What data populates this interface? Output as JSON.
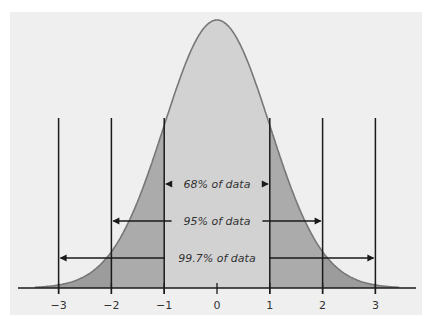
{
  "chart_data": {
    "type": "area",
    "title": "",
    "xlabel": "",
    "ylabel": "",
    "x_ticks": [
      "-3",
      "-2",
      "-1",
      "0",
      "1",
      "2",
      "3"
    ],
    "x_tick_values": [
      -3,
      -2,
      -1,
      0,
      1,
      2,
      3
    ],
    "xlim": [
      -3.4,
      3.4
    ],
    "grid": false,
    "legend": null,
    "regions": [
      {
        "name": "within_1_sd",
        "range": [
          -1,
          1
        ],
        "percent": 68,
        "label": "68% of data",
        "color": "#d2d2d2"
      },
      {
        "name": "within_2_sd",
        "range": [
          -2,
          2
        ],
        "percent": 95,
        "label": "95% of data",
        "color": "#ababab"
      },
      {
        "name": "within_3_sd",
        "range": [
          -3,
          3
        ],
        "percent": 99.7,
        "label": "99.7% of data",
        "color": "#9c9c9c"
      }
    ],
    "annotations": [
      {
        "text": "68% of data",
        "from": -1,
        "to": 1
      },
      {
        "text": "95% of data",
        "from": -2,
        "to": 2
      },
      {
        "text": "99.7% of data",
        "from": -3,
        "to": 3
      }
    ],
    "curve": {
      "mean": 0,
      "sd": 1,
      "stroke": "#777777"
    }
  },
  "colors": {
    "panel": "#efefef",
    "center_fill": "#d2d2d2",
    "band2_fill": "#ababab",
    "tail_fill": "#9c9c9c",
    "lines": "#1a1a1a"
  }
}
